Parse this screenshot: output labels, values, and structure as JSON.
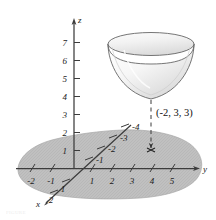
{
  "figure": {
    "background_color": "#ffffff",
    "axis_color": "#3c3c3c",
    "plane_fill_color": "#bcbcbc",
    "plane_edge_color": "#a8a8a8",
    "bowl_fill_color": "#f4f4f4",
    "bowl_edge_color": "#5a5a5a",
    "dash_color": "#3a3a3a"
  },
  "axes": {
    "z": {
      "name": "z",
      "ticks": [
        "1",
        "2",
        "3",
        "4",
        "5",
        "6",
        "7"
      ]
    },
    "y": {
      "name": "y",
      "ticks_positive": [
        "1",
        "2",
        "3",
        "4",
        "5"
      ],
      "ticks_negative": [
        "-1",
        "-2"
      ]
    },
    "x": {
      "name": "x",
      "ticks_positive": [
        "1",
        "2"
      ],
      "ticks_negative": [
        "-1",
        "-2",
        "-3",
        "-4"
      ]
    }
  },
  "annotations": {
    "point_label": "(-2, 3, 3)",
    "point_marker": "arrow-tip-marker"
  },
  "surface": {
    "name": "paraboloid-bowl",
    "description": "elliptic paraboloid bowl"
  },
  "caption": {
    "text": "FIGURE"
  }
}
